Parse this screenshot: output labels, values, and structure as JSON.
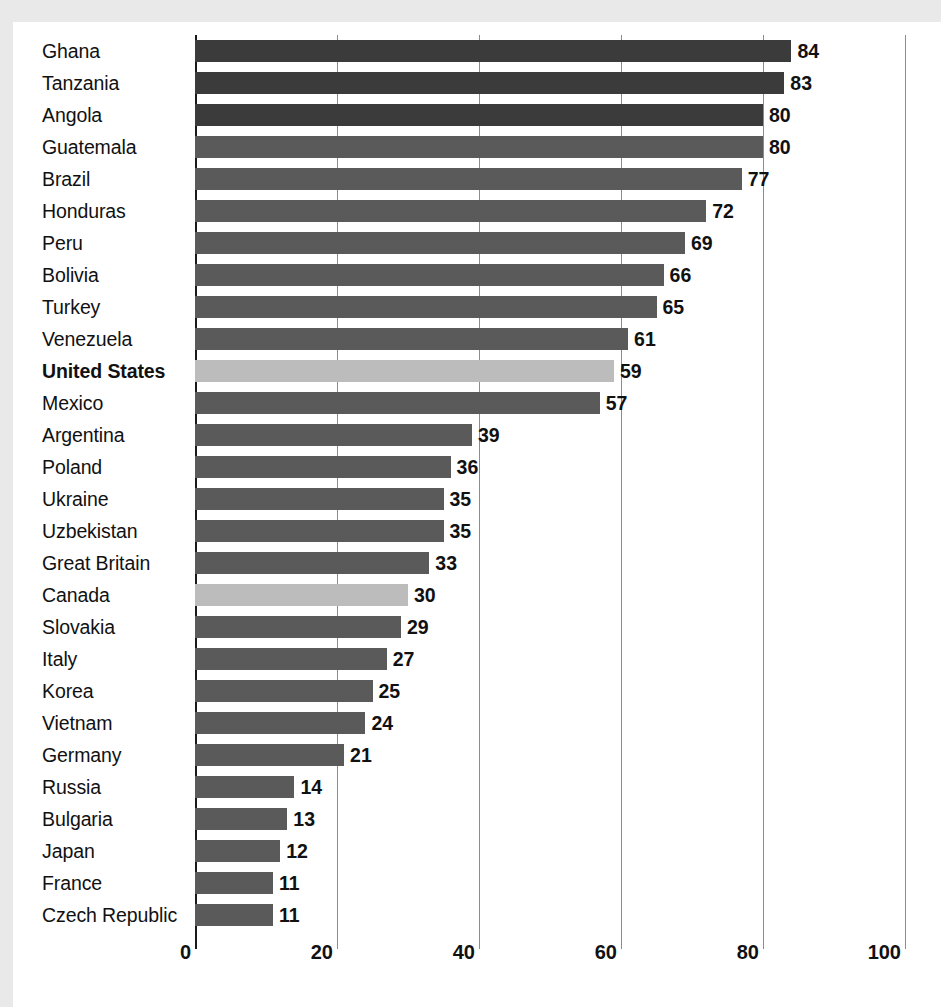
{
  "chart_data": {
    "type": "bar",
    "orientation": "horizontal",
    "title": "",
    "subtitle": "",
    "xlabel": "",
    "ylabel": "",
    "xlim": [
      0,
      100
    ],
    "xticks": [
      0,
      20,
      40,
      60,
      80,
      100
    ],
    "xtick_labels": [
      "0",
      "20",
      "40",
      "60",
      "80",
      "100"
    ],
    "grid": true,
    "grid_axis": "x",
    "legend": "none",
    "value_labels": true,
    "categories": [
      "Ghana",
      "Tanzania",
      "Angola",
      "Guatemala",
      "Brazil",
      "Honduras",
      "Peru",
      "Bolivia",
      "Turkey",
      "Venezuela",
      "United States",
      "Mexico",
      "Argentina",
      "Poland",
      "Ukraine",
      "Uzbekistan",
      "Great Britain",
      "Canada",
      "Slovakia",
      "Italy",
      "Korea",
      "Vietnam",
      "Germany",
      "Russia",
      "Bulgaria",
      "Japan",
      "France",
      "Czech Republic"
    ],
    "values": [
      84,
      83,
      80,
      80,
      77,
      72,
      69,
      66,
      65,
      61,
      59,
      57,
      39,
      36,
      35,
      35,
      33,
      30,
      29,
      27,
      25,
      24,
      21,
      14,
      13,
      12,
      11,
      11
    ],
    "bar_styles": [
      "dark",
      "dark",
      "dark",
      "normal",
      "normal",
      "normal",
      "normal",
      "normal",
      "normal",
      "normal",
      "light",
      "normal",
      "normal",
      "normal",
      "normal",
      "normal",
      "normal",
      "light",
      "normal",
      "normal",
      "normal",
      "normal",
      "normal",
      "normal",
      "normal",
      "normal",
      "normal",
      "normal"
    ],
    "highlighted": [
      "United States",
      "Canada"
    ],
    "bold_labels": [
      "United States"
    ],
    "colors": {
      "bar_dark": "#3b3b3b",
      "bar_normal": "#5a5a5a",
      "bar_light": "#bcbcbc",
      "gridline": "#8c8c8c",
      "axis": "#1a1a1a",
      "text": "#111111",
      "plot_background": "#ffffff",
      "page_background": "#e9e9e9"
    }
  }
}
